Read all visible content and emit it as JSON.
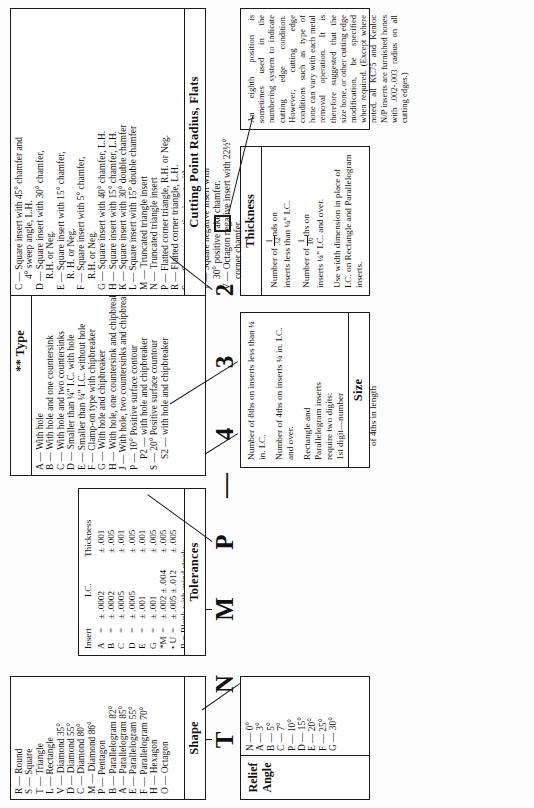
{
  "shape": {
    "caption": "Shape",
    "items": [
      "R — Round",
      "S — Square",
      "T — Triangle",
      "L — Rectangle",
      "V — Diamond 35°",
      "D — Diamond 55°",
      "C — Diamond 80°",
      "M — Diamond 86°",
      "P — Pentagon",
      "B — Parallelogram 82°",
      "A — Parallelogram 85°",
      "E — Parallelogram 55°",
      "F — Parallelogram 70°",
      "H — Hexagon",
      "O — Octagon"
    ]
  },
  "relief": {
    "caption_line1": "Relief",
    "caption_line2": "Angle",
    "items": [
      "N — 0°",
      "A — 3°",
      "B — 5°",
      "C — 7°",
      "P — 10°",
      "D — 15°",
      "E — 20°",
      "F — 25°",
      "G — 30°"
    ]
  },
  "tolerances": {
    "caption": "Tolerances",
    "col_insert": "Insert",
    "col_ic": "I.C.",
    "col_thickness": "Thickness",
    "rows": [
      {
        "code": "A",
        "ic": "± .0002",
        "thk": "± .001"
      },
      {
        "code": "B",
        "ic": "± .0002",
        "thk": "± .005"
      },
      {
        "code": "C",
        "ic": "± .0005",
        "thk": "± .001"
      },
      {
        "code": "D",
        "ic": "± .0005",
        "thk": "± .005"
      },
      {
        "code": "E",
        "ic": "± .001",
        "thk": "± .001"
      },
      {
        "code": "G",
        "ic": "± .001",
        "thk": "± .005"
      },
      {
        "code": "*M",
        "ic": "± .002 ± .004",
        "thk": "± .005"
      },
      {
        "code": "• U",
        "ic": "± .005 ± .012",
        "thk": "± .005"
      }
    ],
    "note_r": "R = Blank with grind stock",
    "note_r2": "on all surfaces."
  },
  "type": {
    "caption": "** Type",
    "items": [
      "A — With hole",
      "B — With hole and one countersink",
      "C — With hole and two countersinks",
      "D — Smaller than ¼\" I.C. with hole",
      "E — Smaller than ¼\" I.C. without hole",
      "F — Clamp-on type with chipbreaker",
      "G — With hole and chipbreaker",
      "H — With hole, one countersink and chipbreaker",
      "J — With hole, two countersinks and chipbreaker",
      "P — 10° Positive surface contour",
      "P2 — with hole and chipbreaker",
      "S — 20° Positive surface countour",
      "S2 — with hole and chipbreaker"
    ]
  },
  "size": {
    "caption": "Size",
    "para1": "Number of 8ths on inserts less than ¼ in. I.C.",
    "para2": "Number of 4ths on inserts ¼ in. I.C. and over.",
    "para3_l1": "Rectangle and",
    "para3_l2": "Parallelogram inserts",
    "para3_l3": "require two digits:",
    "para3_l4": "1st digit—number",
    "para3_l5": "of 8ths in width",
    "para3_l6": "2nd digit—number",
    "para3_l7": "of 4ths in length"
  },
  "thickness": {
    "caption": "Thickness",
    "para1_a": "Number of ",
    "para1_b": "nds on",
    "para1_c": "inserts less than ¼\" I.C.",
    "para2_a": "Number of ",
    "para2_b": "ths on",
    "para2_c": "inserts ¼\" I.C. and over.",
    "para3": "Use width dimension in place of I.C. on Rectangle and Parallelogram inserts."
  },
  "cutting_point": {
    "caption": "Cutting Point Radius, Flats",
    "items": [
      "C — Square insert with 45° chamfer and",
      "4° sweep angle, L.H.",
      "D — Square insert with 30° chamfer,",
      "R.H. or Neg.",
      "E — Square insert with 15° chamfer,",
      "R. H. or Neg.",
      "F — Square insert with 5° chamfer,",
      "R.H. or Neg.",
      "G — Square insert with 40° chamfer, L.H.",
      "H — Square insert with 15° chamfer, L.H.",
      "K — Square insert with 30° double chamfer",
      "L — Square insert with 15° double chamfer",
      "M — Truncated triangle insert",
      "N — Truncated triangle insert",
      "P — Flatted corner triangle, R.H. or Neg.",
      "R — Flatted corner triangle, L.H.",
      "S — Square negative insert with",
      "10° double chamfer.",
      "T — Square negative insert with",
      "30° positive rake chamfer.",
      "V — Octagon negative insert with 22½°",
      "corner chamfer."
    ]
  },
  "note": {
    "text": "An eighth position is sometimes used in the numbering system to indicate cutting edge condition. However, cutting edge conditions such as type of hone can vary with each metal removal operation. It is therefore suggested that the size hone, or other cutting edge modification, be specified when required. (Except where noted, all KC75 and Kenloc N/P inserts are furnished hones with .002-.003 radius on all cutting edges.)"
  },
  "code_string": {
    "g1": "T",
    "g2": "N",
    "g3": "M",
    "g4": "P",
    "dash": "—",
    "g5": "4",
    "g6": "3",
    "g7": "2",
    "g8_icon": "square-outline"
  }
}
